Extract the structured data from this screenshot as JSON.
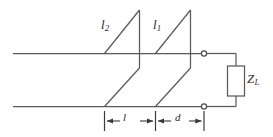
{
  "figure": {
    "type": "schematic-diagram",
    "width": 273,
    "height": 137,
    "background_color": "#ffffff",
    "line_color": "#5a5a5a",
    "text_color": "#2b2b2b"
  },
  "labels": {
    "stub_two": {
      "symbol": "l",
      "subscript": "2"
    },
    "stub_one": {
      "symbol": "l",
      "subscript": "1"
    },
    "load": {
      "symbol": "Z",
      "subscript": "L"
    },
    "dimension_l": {
      "symbol": "l"
    },
    "dimension_d": {
      "symbol": "d"
    }
  },
  "components": {
    "load_box": {
      "name": "load-impedance-box",
      "label": "Z_L"
    },
    "terminals": [
      {
        "name": "upper-terminal",
        "shape": "open-circle"
      },
      {
        "name": "lower-terminal",
        "shape": "open-circle"
      }
    ],
    "stubs": [
      {
        "name": "stub-2",
        "label": "l_2"
      },
      {
        "name": "stub-1",
        "label": "l_1"
      }
    ],
    "transmission_lines": [
      {
        "name": "upper-conductor"
      },
      {
        "name": "lower-conductor"
      }
    ],
    "dimensions": [
      {
        "name": "dimension-l",
        "label": "l"
      },
      {
        "name": "dimension-d",
        "label": "d"
      }
    ]
  }
}
